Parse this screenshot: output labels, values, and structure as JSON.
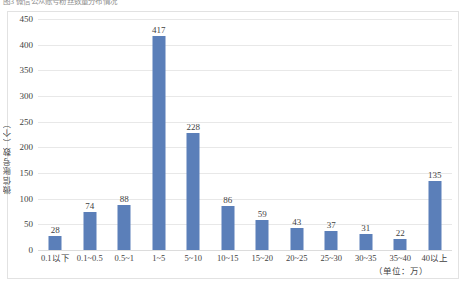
{
  "caption": {
    "text": "图3 微信公众账号粉丝数量分布情况"
  },
  "chart_data": {
    "type": "bar",
    "title": "",
    "xlabel": "（单位：万）",
    "ylabel": "微信账号数（个）",
    "categories": [
      "0.1以下",
      "0.1~0.5",
      "0.5~1",
      "1~5",
      "5~10",
      "10~15",
      "15~20",
      "20~25",
      "25~30",
      "30~35",
      "35~40",
      "40以上"
    ],
    "values": [
      28,
      74,
      88,
      417,
      228,
      86,
      59,
      43,
      37,
      31,
      22,
      135
    ],
    "ylim": [
      0,
      450
    ],
    "yticks": [
      0,
      50,
      100,
      150,
      200,
      250,
      300,
      350,
      400,
      450
    ],
    "grid": true,
    "legend": "none",
    "bar_color": "#5b7fb9",
    "gridline_color": "#e8e8e8",
    "frame_color": "#e2e2e2"
  },
  "axis": {
    "unit_note": "（单位：万）",
    "y_title": "微信账号数（个）"
  }
}
